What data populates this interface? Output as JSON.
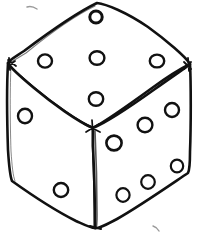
{
  "scene": {
    "title": "Hand-drawn dice sketch",
    "subject": "die",
    "view": "isometric three-quarter",
    "background_color": "#ffffff",
    "ink_color": "#111111",
    "face_fill_color": "#ffffff",
    "style": "hand-drawn ink line sketch",
    "canvas": {
      "width": 199,
      "height": 235
    }
  },
  "dice": {
    "total_visible_pips": 13,
    "faces": [
      {
        "id": "top",
        "name": "top-face",
        "label": "Top face",
        "pip_count": 5,
        "pip_pattern": "quincunx",
        "outline_points": "97,3 8,62 93,128 190,65",
        "pips": [
          {
            "cx": 96,
            "cy": 17,
            "rx": 6.2,
            "ry": 6.0
          },
          {
            "cx": 45,
            "cy": 61,
            "rx": 7.0,
            "ry": 6.6
          },
          {
            "cx": 97,
            "cy": 58,
            "rx": 7.4,
            "ry": 6.8
          },
          {
            "cx": 157,
            "cy": 61,
            "rx": 7.2,
            "ry": 6.4
          },
          {
            "cx": 96,
            "cy": 99,
            "rx": 7.2,
            "ry": 6.8
          }
        ]
      },
      {
        "id": "left",
        "name": "left-face",
        "label": "Left face",
        "pip_count": 2,
        "pip_pattern": "diagonal",
        "outline_points": "8,62 93,128 95,228 12,180",
        "pips": [
          {
            "cx": 25,
            "cy": 116,
            "rx": 7.0,
            "ry": 7.2
          },
          {
            "cx": 61,
            "cy": 190,
            "rx": 7.2,
            "ry": 7.0
          }
        ]
      },
      {
        "id": "right",
        "name": "right-face",
        "label": "Right face",
        "pip_count": 6,
        "pip_pattern": "two-columns-of-three",
        "outline_points": "93,128 190,65 190,172 95,228",
        "pips": [
          {
            "cx": 114,
            "cy": 143,
            "rx": 7.6,
            "ry": 7.4
          },
          {
            "cx": 145,
            "cy": 125,
            "rx": 7.4,
            "ry": 7.2
          },
          {
            "cx": 172,
            "cy": 110,
            "rx": 7.0,
            "ry": 7.0
          },
          {
            "cx": 123,
            "cy": 195,
            "rx": 6.6,
            "ry": 6.8
          },
          {
            "cx": 148,
            "cy": 182,
            "rx": 6.8,
            "ry": 6.8
          },
          {
            "cx": 177,
            "cy": 166,
            "rx": 6.2,
            "ry": 6.4
          }
        ]
      }
    ],
    "vertices": {
      "top_apex": {
        "x": 97,
        "y": 3
      },
      "left_upper": {
        "x": 8,
        "y": 62
      },
      "right_upper": {
        "x": 190,
        "y": 65
      },
      "center": {
        "x": 93,
        "y": 128
      },
      "left_lower": {
        "x": 12,
        "y": 180
      },
      "right_lower": {
        "x": 190,
        "y": 172
      },
      "bottom": {
        "x": 95,
        "y": 228
      }
    },
    "stray_marks": [
      {
        "id": "upper-left-speck",
        "x": 30,
        "y": 8
      },
      {
        "id": "lower-right-speck",
        "x": 155,
        "y": 227
      }
    ]
  }
}
